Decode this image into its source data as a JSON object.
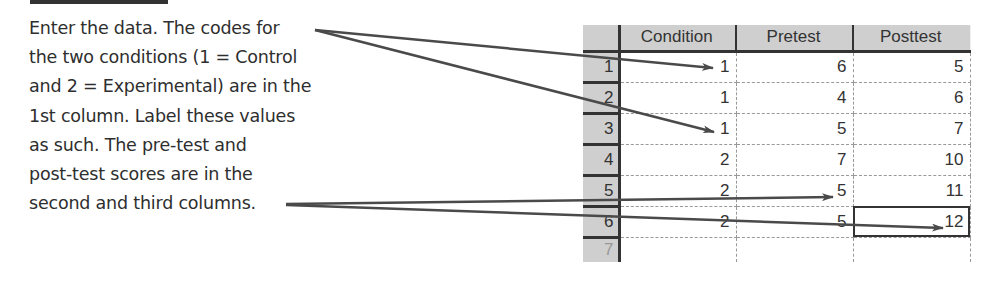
{
  "instruction": {
    "lines": [
      "Enter the data. The codes for",
      "the two conditions (1 = Control",
      "and 2 = Experimental) are in the",
      "1st column. Label these values",
      "as such. The pre-test and",
      "post-test scores are in the",
      "second and third columns."
    ]
  },
  "spreadsheet": {
    "columns": [
      "Condition",
      "Pretest",
      "Posttest"
    ],
    "rows": [
      {
        "num": "1",
        "cells": [
          "1",
          "6",
          "5"
        ]
      },
      {
        "num": "2",
        "cells": [
          "1",
          "4",
          "6"
        ]
      },
      {
        "num": "3",
        "cells": [
          "1",
          "5",
          "7"
        ]
      },
      {
        "num": "4",
        "cells": [
          "2",
          "7",
          "10"
        ]
      },
      {
        "num": "5",
        "cells": [
          "2",
          "5",
          "11"
        ]
      },
      {
        "num": "6",
        "cells": [
          "2",
          "5",
          "12"
        ]
      },
      {
        "num": "7",
        "cells": [
          "",
          "",
          ""
        ]
      }
    ],
    "selected_cell": {
      "row": "6",
      "column": "Posttest"
    }
  },
  "colors": {
    "arrow": "#4a4a4a",
    "header_bg": "#cfcfcf",
    "text": "#2e2e2e"
  }
}
